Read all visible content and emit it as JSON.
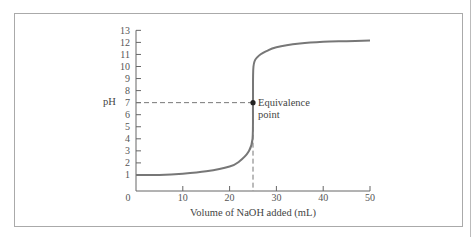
{
  "chart_data": {
    "type": "line",
    "title": "",
    "xlabel": "Volume of NaOH added (mL)",
    "ylabel": "pH",
    "xlim": [
      0,
      50
    ],
    "ylim": [
      0,
      13
    ],
    "x_ticks": [
      0,
      10,
      20,
      30,
      40,
      50
    ],
    "y_ticks": [
      1,
      2,
      3,
      4,
      5,
      6,
      7,
      8,
      9,
      10,
      11,
      12,
      13
    ],
    "x_tick_labels": [
      "0",
      "10",
      "20",
      "30",
      "40",
      "50"
    ],
    "y_tick_labels": [
      "0",
      "1",
      "2",
      "3",
      "4",
      "5",
      "6",
      "7",
      "8",
      "9",
      "10",
      "11",
      "12",
      "13"
    ],
    "grid": false,
    "legend": null,
    "series": [
      {
        "name": "Titration curve",
        "x": [
          0,
          5,
          10,
          15,
          20,
          22,
          24,
          24.9,
          25,
          25.1,
          26,
          28,
          30,
          35,
          40,
          45,
          50
        ],
        "y": [
          1.0,
          1.0,
          1.1,
          1.3,
          1.7,
          2.1,
          2.9,
          4.0,
          7.0,
          10.0,
          10.8,
          11.3,
          11.6,
          11.9,
          12.05,
          12.1,
          12.15
        ]
      }
    ],
    "annotations": [
      {
        "text": "Equivalence point",
        "x": 25,
        "y": 7,
        "marker": "dot",
        "dashed_guides": true
      }
    ]
  },
  "labels": {
    "ylabel": "pH",
    "xlabel": "Volume of NaOH added (mL)",
    "annot_line1": "Equivalence",
    "annot_line2": "point"
  }
}
